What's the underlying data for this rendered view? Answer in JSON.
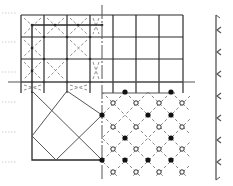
{
  "diagram": {
    "title": "",
    "colors": {
      "line": "#2a2a2a",
      "light_line": "#555555",
      "dashed": "#777777",
      "tick": "#cfcfcf",
      "bracket": "#555555",
      "dot_fill": "#111111",
      "background": "#ffffff"
    },
    "outer_grid": {
      "x_lines": [
        21,
        44,
        67,
        90,
        113,
        136,
        159,
        183
      ],
      "y_lines": [
        15,
        37,
        59,
        82
      ],
      "x_start": 21,
      "x_end": 183,
      "y_start": 15,
      "y_end": 93
    },
    "inner_grid": {
      "x_lines": [
        32,
        102
      ],
      "y_lines": [
        25
      ],
      "x_cells_marked": [
        [
          21,
          15,
          44,
          37
        ],
        [
          44,
          15,
          67,
          37
        ],
        [
          67,
          15,
          90,
          37
        ],
        [
          90,
          15,
          102,
          37
        ],
        [
          21,
          37,
          44,
          59
        ],
        [
          67,
          37,
          90,
          59
        ],
        [
          21,
          59,
          44,
          82
        ],
        [
          44,
          59,
          67,
          82
        ],
        [
          90,
          59,
          102,
          82
        ],
        [
          21,
          82,
          44,
          93
        ],
        [
          67,
          82,
          90,
          93
        ]
      ]
    },
    "axis_line_horizontal": {
      "x1": 8,
      "x2": 195,
      "y": 82
    },
    "secondary_line_horizontal": {
      "x1": 102,
      "x2": 175,
      "y": 93
    },
    "axis_line_vertical_dashed": {
      "x": 102,
      "y1": 5,
      "y2": 180
    },
    "lower_square": {
      "x1": 32,
      "y1": 91,
      "x2": 102,
      "y2": 160
    },
    "solid_dots": [
      [
        125,
        92
      ],
      [
        171,
        92
      ],
      [
        102,
        115
      ],
      [
        148,
        115
      ],
      [
        171,
        115
      ],
      [
        125,
        138
      ],
      [
        171,
        138
      ],
      [
        102,
        160
      ],
      [
        125,
        160
      ],
      [
        148,
        160
      ],
      [
        171,
        160
      ]
    ],
    "open_dots": [
      [
        113,
        103
      ],
      [
        136,
        103
      ],
      [
        159,
        103
      ],
      [
        182,
        103
      ],
      [
        113,
        127
      ],
      [
        136,
        127
      ],
      [
        159,
        127
      ],
      [
        182,
        127
      ],
      [
        113,
        149
      ],
      [
        136,
        149
      ],
      [
        159,
        149
      ],
      [
        182,
        149
      ],
      [
        113,
        172
      ],
      [
        136,
        172
      ],
      [
        159,
        172
      ],
      [
        182,
        172
      ]
    ],
    "left_ticks_y": [
      13,
      42,
      72,
      102,
      132,
      162
    ],
    "right_bracket": {
      "x": 216,
      "y1": 15,
      "y2": 180,
      "arrows_y": [
        30,
        52,
        74,
        96,
        118,
        140,
        162
      ]
    }
  }
}
